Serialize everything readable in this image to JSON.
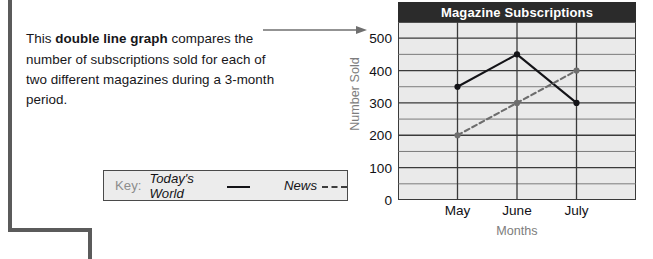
{
  "description": {
    "line_prefix": "This ",
    "emphasis": "double line graph",
    "line_rest": " compares the number of subscriptions sold for each of two different magazines during a 3-month period."
  },
  "key": {
    "label": "Key:",
    "entries": [
      {
        "name": "Today's World",
        "style": "solid",
        "color": "#141418"
      },
      {
        "name": "News",
        "style": "dashed",
        "color": "#3d3d3d"
      }
    ]
  },
  "chart_data": {
    "type": "line",
    "title": "Magazine Subscriptions",
    "xlabel": "Months",
    "ylabel": "Number Sold",
    "categories": [
      "May",
      "June",
      "July"
    ],
    "series": [
      {
        "name": "Today's World",
        "values": [
          350,
          450,
          300
        ],
        "style": "solid",
        "color": "#141418"
      },
      {
        "name": "News",
        "values": [
          200,
          300,
          400
        ],
        "style": "dashed",
        "color": "#6e6e6e"
      }
    ],
    "ylim": [
      0,
      550
    ],
    "yticks": [
      0,
      100,
      200,
      300,
      400,
      500
    ],
    "ytick_labels": [
      "0",
      "100",
      "200",
      "300",
      "400",
      "500"
    ],
    "minor_gridline_step": 50,
    "grid": true,
    "legend_position": "external-key-box",
    "title_bar_color": "#2b2b2b",
    "plot_background": "#eaeaea"
  }
}
